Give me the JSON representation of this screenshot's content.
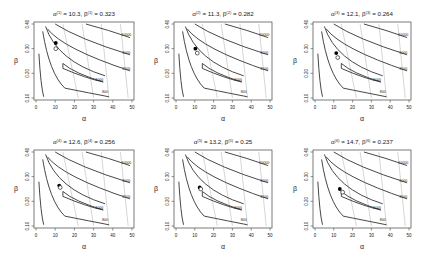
{
  "figure": {
    "panel_count": 6,
    "layout": "2 rows x 3 columns"
  },
  "chart_data": [
    {
      "type": "contour",
      "title": "α^(1) = 10.3, β^(1) = 0.323",
      "title_parts": {
        "alpha_sup": "(1)",
        "alpha_val": "10.3",
        "beta_sup": "(1)",
        "beta_val": "0.323"
      },
      "xlabel": "α",
      "ylabel": "β",
      "xlim": [
        0,
        50
      ],
      "ylim": [
        0.1,
        0.4
      ],
      "xticks": [
        0,
        10,
        20,
        30,
        40,
        50
      ],
      "yticks": [
        0.1,
        0.2,
        0.3,
        0.4
      ],
      "contour_levels": [
        800,
        1000,
        1500,
        5000,
        10000
      ],
      "current_point": {
        "alpha": 10.3,
        "beta": 0.323,
        "marker": "filled-circle"
      },
      "next_point": {
        "alpha": 10.3,
        "beta": 0.3,
        "marker": "open-circle"
      }
    },
    {
      "type": "contour",
      "title": "α^(2) = 11.3, β^(2) = 0.282",
      "title_parts": {
        "alpha_sup": "(2)",
        "alpha_val": "11.3",
        "beta_sup": "(2)",
        "beta_val": "0.282"
      },
      "xlabel": "α",
      "ylabel": "β",
      "xlim": [
        0,
        50
      ],
      "ylim": [
        0.1,
        0.4
      ],
      "xticks": [
        0,
        10,
        20,
        30,
        40,
        50
      ],
      "yticks": [
        0.1,
        0.2,
        0.3,
        0.4
      ],
      "contour_levels": [
        800,
        1000,
        1500,
        5000,
        10000
      ],
      "current_point": {
        "alpha": 10.3,
        "beta": 0.3,
        "marker": "filled-circle"
      },
      "next_point": {
        "alpha": 11.3,
        "beta": 0.282,
        "marker": "open-circle"
      }
    },
    {
      "type": "contour",
      "title": "α^(3) = 12.1, β^(3) = 0.264",
      "title_parts": {
        "alpha_sup": "(3)",
        "alpha_val": "12.1",
        "beta_sup": "(3)",
        "beta_val": "0.264"
      },
      "xlabel": "α",
      "ylabel": "β",
      "xlim": [
        0,
        50
      ],
      "ylim": [
        0.1,
        0.4
      ],
      "xticks": [
        0,
        10,
        20,
        30,
        40,
        50
      ],
      "yticks": [
        0.1,
        0.2,
        0.3,
        0.4
      ],
      "contour_levels": [
        800,
        1000,
        1500,
        5000,
        10000
      ],
      "current_point": {
        "alpha": 11.3,
        "beta": 0.282,
        "marker": "filled-circle"
      },
      "next_point": {
        "alpha": 12.1,
        "beta": 0.264,
        "marker": "open-circle"
      }
    },
    {
      "type": "contour",
      "title": "α^(4) = 12.6, β^(4) = 0.256",
      "title_parts": {
        "alpha_sup": "(4)",
        "alpha_val": "12.6",
        "beta_sup": "(4)",
        "beta_val": "0.256"
      },
      "xlabel": "α",
      "ylabel": "β",
      "xlim": [
        0,
        50
      ],
      "ylim": [
        0.1,
        0.4
      ],
      "xticks": [
        0,
        10,
        20,
        30,
        40,
        50
      ],
      "yticks": [
        0.1,
        0.2,
        0.3,
        0.4
      ],
      "contour_levels": [
        800,
        1000,
        1500,
        5000,
        10000
      ],
      "current_point": {
        "alpha": 12.1,
        "beta": 0.264,
        "marker": "filled-circle"
      },
      "next_point": {
        "alpha": 12.6,
        "beta": 0.256,
        "marker": "open-circle"
      }
    },
    {
      "type": "contour",
      "title": "α^(5) = 13.2, β^(5) = 0.25",
      "title_parts": {
        "alpha_sup": "(5)",
        "alpha_val": "13.2",
        "beta_sup": "(5)",
        "beta_val": "0.25"
      },
      "xlabel": "α",
      "ylabel": "β",
      "xlim": [
        0,
        50
      ],
      "ylim": [
        0.1,
        0.4
      ],
      "xticks": [
        0,
        10,
        20,
        30,
        40,
        50
      ],
      "yticks": [
        0.1,
        0.2,
        0.3,
        0.4
      ],
      "contour_levels": [
        800,
        1000,
        1500,
        5000,
        10000
      ],
      "current_point": {
        "alpha": 12.6,
        "beta": 0.256,
        "marker": "filled-circle"
      },
      "next_point": {
        "alpha": 13.2,
        "beta": 0.25,
        "marker": "open-circle"
      }
    },
    {
      "type": "contour",
      "title": "α^(6) = 14.7, β^(6) = 0.237",
      "title_parts": {
        "alpha_sup": "(6)",
        "alpha_val": "14.7",
        "beta_sup": "(6)",
        "beta_val": "0.237"
      },
      "xlabel": "α",
      "ylabel": "β",
      "xlim": [
        0,
        50
      ],
      "ylim": [
        0.1,
        0.4
      ],
      "xticks": [
        0,
        10,
        20,
        30,
        40,
        50
      ],
      "yticks": [
        0.1,
        0.2,
        0.3,
        0.4
      ],
      "contour_levels": [
        800,
        1000,
        1500,
        5000,
        10000
      ],
      "current_point": {
        "alpha": 13.2,
        "beta": 0.25,
        "marker": "filled-circle"
      },
      "next_point": {
        "alpha": 14.7,
        "beta": 0.237,
        "marker": "open-circle"
      }
    }
  ],
  "labels": {
    "xticks": [
      "0",
      "10",
      "20",
      "30",
      "40",
      "50"
    ],
    "yticks": [
      "0.10",
      "0.20",
      "0.30",
      "0.40"
    ],
    "xlabel": "α",
    "ylabel": "β",
    "contour_labels": [
      "10000",
      "5000",
      "1500",
      "1000",
      "800",
      "1000",
      "1500",
      "5000"
    ]
  },
  "colors": {
    "contour_main": "#333333",
    "contour_light": "#bbbbbb",
    "axis": "#444444",
    "text": "#222222"
  }
}
